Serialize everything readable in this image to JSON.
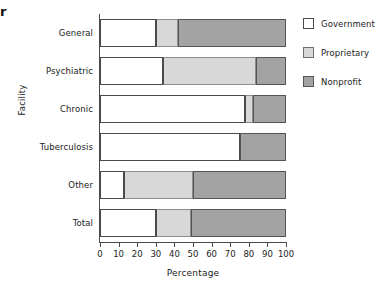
{
  "edge_artifact": "r",
  "chart_data": {
    "type": "bar",
    "orientation": "horizontal",
    "stacked": true,
    "title": "",
    "xlabel": "Percentage",
    "ylabel": "Facility",
    "xlim": [
      0,
      100
    ],
    "xticks": [
      0,
      10,
      20,
      30,
      40,
      50,
      60,
      70,
      80,
      90,
      100
    ],
    "grid": false,
    "legend_position": "right",
    "categories": [
      "General",
      "Psychiatric",
      "Chronic",
      "Tuberculosis",
      "Other",
      "Total"
    ],
    "series": [
      {
        "name": "Government",
        "color": "#ffffff",
        "values": [
          30,
          34,
          78,
          75,
          13,
          30
        ]
      },
      {
        "name": "Proprietary",
        "color": "#d8d8d8",
        "values": [
          12,
          50,
          4,
          0,
          37,
          19
        ]
      },
      {
        "name": "Nonprofit",
        "color": "#a3a3a3",
        "values": [
          58,
          16,
          18,
          25,
          50,
          51
        ]
      }
    ],
    "xtick_labels": [
      "0",
      "10",
      "20",
      "30",
      "40",
      "50",
      "60",
      "70",
      "80",
      "90",
      "100"
    ],
    "legend_entries": [
      "Government",
      "Proprietary",
      "Nonprofit"
    ]
  }
}
